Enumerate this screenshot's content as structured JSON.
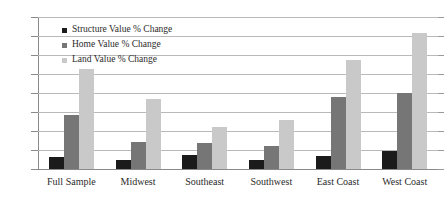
{
  "chart_data": {
    "type": "bar",
    "title": "",
    "xlabel": "",
    "ylabel": "",
    "ylim": [
      0,
      160
    ],
    "ytick_step": 20,
    "ytick_labels": [
      "0%",
      "20%",
      "40%",
      "60%",
      "80%",
      "100%",
      "120%",
      "140%",
      "160%"
    ],
    "grid": true,
    "legend_position": "top-left inside plot",
    "categories": [
      "Full Sample",
      "Midwest",
      "Southeast",
      "Southwest",
      "East Coast",
      "West Coast"
    ],
    "series": [
      {
        "name": "Structure Value % Change",
        "color": "#1b1b1b",
        "values": [
          13,
          9,
          15,
          10,
          14,
          19
        ]
      },
      {
        "name": "Home Value % Change",
        "color": "#767676",
        "values": [
          57,
          28,
          27,
          24,
          76,
          80
        ]
      },
      {
        "name": "Land Value % Change",
        "color": "#c9c9c9",
        "values": [
          105,
          74,
          44,
          52,
          115,
          143
        ]
      }
    ]
  },
  "legend": {
    "items": [
      {
        "label": "Structure Value % Change",
        "swatch": "legend-swatch-structure"
      },
      {
        "label": "Home Value % Change",
        "swatch": "legend-swatch-home"
      },
      {
        "label": "Land Value % Change",
        "swatch": "legend-swatch-land"
      }
    ]
  },
  "colors": {
    "background": "#ffffff",
    "gridline": "#b9b9b9",
    "axis": "#8a8a8a",
    "text": "#2b2b2b"
  }
}
